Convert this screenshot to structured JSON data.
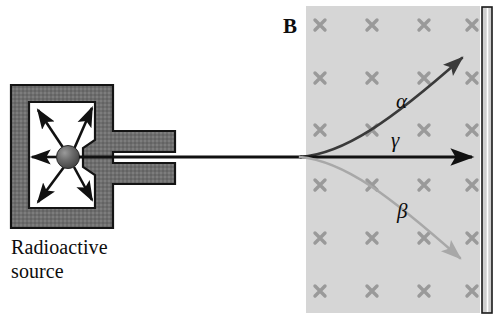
{
  "figure": {
    "width": 501,
    "height": 320,
    "background": "#ffffff"
  },
  "source": {
    "caption_line1": "Radioactive",
    "caption_line2": "source",
    "shield_color": "#6e6e6e",
    "shield_outline": "#1a1a1a",
    "cavity_color": "#ffffff",
    "sphere_color": "#5a5a5a",
    "emission_arrow_count": 6,
    "emission_arrow_color": "#111111"
  },
  "field_region": {
    "symbol": "B",
    "fill_color": "#d6d6d6",
    "marker_glyph": "x",
    "marker_color": "#9a9a9a",
    "marker_meaning": "magnetic-field-into-page",
    "marker_columns": 4,
    "marker_rows": 6,
    "left": 306,
    "right": 480,
    "top": 6,
    "bottom": 313
  },
  "detector": {
    "color": "#cfcfcf",
    "outline": "#1a1a1a",
    "left": 482,
    "right": 492,
    "top": 7,
    "bottom": 313
  },
  "rays": [
    {
      "name": "alpha",
      "label": "α",
      "color": "#3a3a3a",
      "deflection": "upward",
      "charge": "positive",
      "label_x": 396,
      "label_y": 89
    },
    {
      "name": "gamma",
      "label": "γ",
      "color": "#111111",
      "deflection": "none",
      "charge": "neutral",
      "label_x": 391,
      "label_y": 128
    },
    {
      "name": "beta",
      "label": "β",
      "color": "#a8a8a8",
      "deflection": "downward",
      "charge": "negative",
      "label_x": 397,
      "label_y": 199
    }
  ],
  "beam": {
    "axis_y": 157,
    "split_x": 300,
    "collimator_exit_x": 175
  }
}
